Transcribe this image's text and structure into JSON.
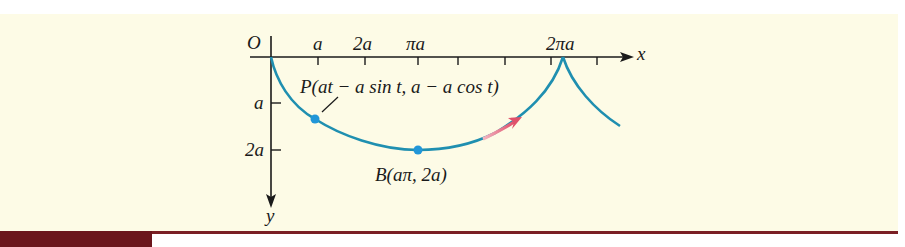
{
  "figure": {
    "type": "cycloid-diagram",
    "origin_label": "O",
    "x_axis_label": "x",
    "y_axis_label": "y",
    "x_ticks": [
      {
        "label": "a",
        "pos": 318
      },
      {
        "label": "2a",
        "pos": 365
      },
      {
        "label": "πa",
        "pos": 418
      },
      {
        "label": "",
        "pos": 458
      },
      {
        "label": "",
        "pos": 505
      },
      {
        "label": "",
        "pos": 551
      },
      {
        "label": "2πa",
        "pos": 563
      },
      {
        "label": "",
        "pos": 597
      }
    ],
    "y_ticks": [
      {
        "label": "a",
        "pos": 103
      },
      {
        "label": "2a",
        "pos": 150
      }
    ],
    "point_P": {
      "label": "P(at − a sin t, a − a cos t)",
      "name": "P"
    },
    "point_B": {
      "label": "B(aπ, 2a)",
      "name": "B"
    },
    "colors": {
      "curve": "#1f8fb0",
      "points": "#2196d8",
      "direction_arrow": "#e0506a",
      "axes": "#1a1a1a",
      "background": "#fdfbe6",
      "rule": "#7a1f24"
    }
  }
}
